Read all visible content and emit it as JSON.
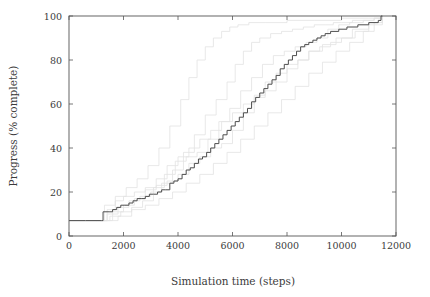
{
  "chart_data": {
    "type": "line",
    "title": "",
    "xlabel": "Simulation time (steps)",
    "ylabel": "Progress (% complete)",
    "xlim": [
      0,
      12000
    ],
    "ylim": [
      0,
      100
    ],
    "xticks": [
      0,
      2000,
      4000,
      6000,
      8000,
      10000,
      12000
    ],
    "yticks": [
      0,
      20,
      40,
      60,
      80,
      100
    ],
    "xtick_labels": [
      "0",
      "2000",
      "4000",
      "6000",
      "8000",
      "10000",
      "12000"
    ],
    "ytick_labels": [
      "0",
      "20",
      "40",
      "60",
      "80",
      "100"
    ],
    "grid": false,
    "legend": "none",
    "step_shape": "post",
    "colors": {
      "main_series": "#4d4d4d",
      "background_series": "#e2e2e2",
      "axis": "#555555",
      "text": "#3b3b3b"
    },
    "series": [
      {
        "name": "mean-progress",
        "role": "main",
        "color": "#4d4d4d",
        "linewidth": 1.0,
        "x": [
          0,
          600,
          1200,
          1250,
          1500,
          1600,
          1750,
          1900,
          2050,
          2200,
          2350,
          2500,
          2650,
          2800,
          2950,
          3100,
          3250,
          3400,
          3550,
          3700,
          3850,
          4000,
          4150,
          4300,
          4450,
          4600,
          4750,
          4900,
          5050,
          5200,
          5350,
          5500,
          5650,
          5800,
          5950,
          6100,
          6250,
          6400,
          6550,
          6700,
          6850,
          7000,
          7150,
          7300,
          7450,
          7600,
          7750,
          7900,
          8050,
          8200,
          8350,
          8500,
          8650,
          8800,
          8950,
          9100,
          9250,
          9400,
          9600,
          9900,
          10200,
          10600,
          11000,
          11350,
          11450,
          11500
        ],
        "y": [
          7,
          7,
          7,
          11,
          11,
          12,
          13,
          14,
          14,
          15,
          16,
          17,
          17,
          18,
          19,
          19,
          20,
          21,
          21,
          24,
          25,
          26,
          28,
          30,
          31,
          33,
          35,
          36,
          38,
          40,
          42,
          44,
          46,
          48,
          50,
          52,
          54,
          56,
          58,
          61,
          63,
          65,
          67,
          69,
          71,
          73,
          76,
          78,
          80,
          82,
          84,
          86,
          87,
          88,
          89,
          90,
          91,
          92,
          93,
          94,
          95,
          96,
          97,
          98,
          100,
          100
        ]
      },
      {
        "name": "run-1",
        "role": "background",
        "color": "#e2e2e2",
        "linewidth": 0.8,
        "x": [
          0,
          900,
          1400,
          1800,
          2200,
          2600,
          3000,
          3400,
          3800,
          4200,
          4600,
          5000,
          5400,
          5800,
          6100,
          6400,
          6700,
          7000,
          7400,
          7800,
          8200,
          8600,
          9000,
          9400,
          9700,
          10000,
          10400,
          10800,
          11200,
          11500
        ],
        "y": [
          7,
          7,
          10,
          13,
          16,
          18,
          20,
          24,
          30,
          38,
          46,
          55,
          62,
          70,
          78,
          84,
          88,
          90,
          92,
          93,
          94,
          95,
          96,
          96,
          97,
          97,
          98,
          98,
          99,
          100
        ]
      },
      {
        "name": "run-2",
        "role": "background",
        "color": "#e2e2e2",
        "linewidth": 0.8,
        "x": [
          0,
          1100,
          1500,
          1900,
          2300,
          2700,
          3100,
          3500,
          3900,
          4300,
          4700,
          5100,
          5500,
          5900,
          6300,
          6700,
          7100,
          7500,
          7900,
          8300,
          8700,
          9100,
          9500,
          9900,
          10300,
          10800,
          11200,
          11500
        ],
        "y": [
          7,
          7,
          9,
          11,
          13,
          16,
          22,
          28,
          34,
          36,
          38,
          44,
          52,
          58,
          66,
          72,
          78,
          82,
          84,
          86,
          88,
          90,
          94,
          96,
          97,
          98,
          99,
          100
        ]
      },
      {
        "name": "run-3",
        "role": "background",
        "color": "#e2e2e2",
        "linewidth": 0.8,
        "x": [
          0,
          1000,
          1400,
          1700,
          2000,
          2400,
          2800,
          3200,
          3600,
          4000,
          4400,
          4800,
          5200,
          5600,
          6000,
          6400,
          6800,
          7200,
          7600,
          8000,
          8400,
          8800,
          9200,
          9600,
          10000,
          10500,
          11000,
          11500
        ],
        "y": [
          7,
          7,
          12,
          16,
          18,
          20,
          22,
          23,
          25,
          28,
          33,
          36,
          40,
          42,
          48,
          56,
          64,
          70,
          74,
          78,
          80,
          84,
          86,
          88,
          90,
          93,
          96,
          100
        ]
      },
      {
        "name": "run-4",
        "role": "background",
        "color": "#e2e2e2",
        "linewidth": 0.8,
        "x": [
          0,
          1200,
          1600,
          2000,
          2400,
          2800,
          3200,
          3600,
          4000,
          4400,
          4800,
          5200,
          5600,
          6000,
          6400,
          6800,
          7200,
          7600,
          8000,
          8400,
          8800,
          9300,
          9800,
          10400,
          11000,
          11500
        ],
        "y": [
          7,
          7,
          11,
          14,
          17,
          21,
          26,
          32,
          36,
          40,
          44,
          48,
          52,
          56,
          60,
          63,
          66,
          70,
          76,
          80,
          84,
          87,
          90,
          94,
          97,
          100
        ]
      },
      {
        "name": "run-5-fast",
        "role": "background",
        "color": "#e2e2e2",
        "linewidth": 0.8,
        "x": [
          0,
          1000,
          1300,
          1700,
          2100,
          2500,
          2900,
          3300,
          3700,
          4100,
          4400,
          4700,
          5000,
          5300,
          5600,
          5900,
          6200,
          6600,
          7200,
          8000,
          9000,
          10000,
          11000,
          11500
        ],
        "y": [
          7,
          7,
          14,
          18,
          22,
          26,
          32,
          40,
          50,
          62,
          72,
          80,
          86,
          90,
          93,
          95,
          96,
          97,
          97,
          98,
          98,
          99,
          99,
          100
        ]
      },
      {
        "name": "run-6-slow",
        "role": "background",
        "color": "#e2e2e2",
        "linewidth": 0.8,
        "x": [
          0,
          1300,
          1800,
          2300,
          2800,
          3300,
          3800,
          4300,
          4800,
          5300,
          5800,
          6300,
          6800,
          7300,
          7800,
          8300,
          8800,
          9300,
          9800,
          10300,
          10800,
          11200,
          11500
        ],
        "y": [
          7,
          7,
          9,
          12,
          14,
          17,
          20,
          24,
          28,
          33,
          38,
          44,
          50,
          56,
          62,
          68,
          74,
          79,
          84,
          88,
          93,
          97,
          100
        ]
      }
    ]
  },
  "axes": {
    "x_label": "Simulation time (steps)",
    "y_label": "Progress (% complete)"
  }
}
